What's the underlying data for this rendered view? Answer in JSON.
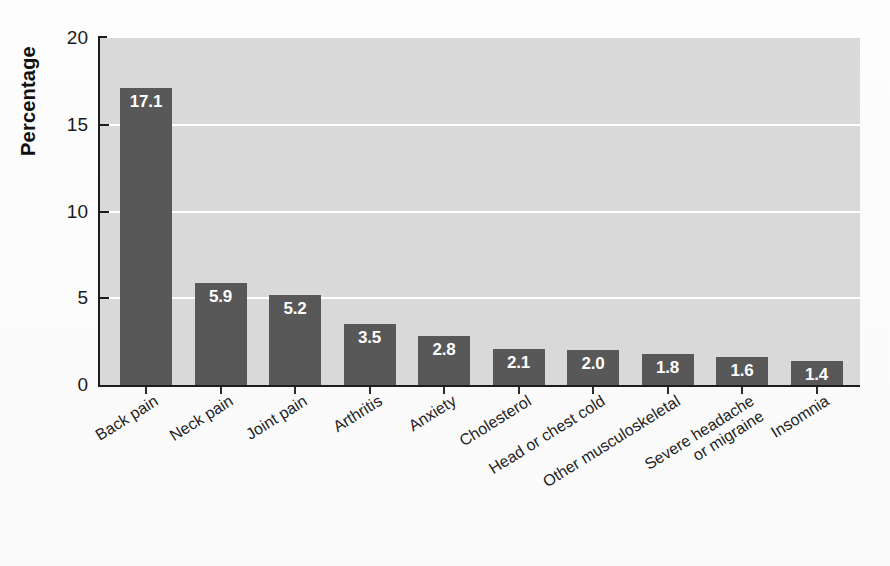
{
  "chart_data": {
    "type": "bar",
    "title": "",
    "subtitle": "",
    "xlabel": "",
    "ylabel": "Percentage",
    "ylim": [
      0,
      20
    ],
    "yticks": [
      0,
      5,
      10,
      15,
      20
    ],
    "grid": "horizontal",
    "legend": "none",
    "orientation": "vertical",
    "value_label_position": "inside-top",
    "categories": [
      "Back pain",
      "Neck pain",
      "Joint pain",
      "Arthritis",
      "Anxiety",
      "Cholesterol",
      "Head or chest cold",
      "Other musculoskeletal",
      "Severe headache or migraine",
      "Insomnia"
    ],
    "category_lines": [
      [
        "Back pain"
      ],
      [
        "Neck pain"
      ],
      [
        "Joint pain"
      ],
      [
        "Arthritis"
      ],
      [
        "Anxiety"
      ],
      [
        "Cholesterol"
      ],
      [
        "Head or chest cold"
      ],
      [
        "Other musculoskeletal"
      ],
      [
        "Severe headache",
        "or migraine"
      ],
      [
        "Insomnia"
      ]
    ],
    "values": [
      17.1,
      5.9,
      5.2,
      3.5,
      2.8,
      2.1,
      2.0,
      1.8,
      1.6,
      1.4
    ],
    "value_labels": [
      "17.1",
      "5.9",
      "5.2",
      "3.5",
      "2.8",
      "2.1",
      "2.0",
      "1.8",
      "1.6",
      "1.4"
    ],
    "colors": {
      "bar": "#585858",
      "plot_background": "#d9d9d9",
      "gridline": "#ffffff",
      "axis": "#1c1c1c",
      "value_label": "#ffffff",
      "tick_label": "#1b1b1b",
      "page_background": "#fdfdfd"
    }
  },
  "axis": {
    "ytick_labels": [
      "20",
      "15",
      "10",
      "5",
      "0"
    ]
  }
}
